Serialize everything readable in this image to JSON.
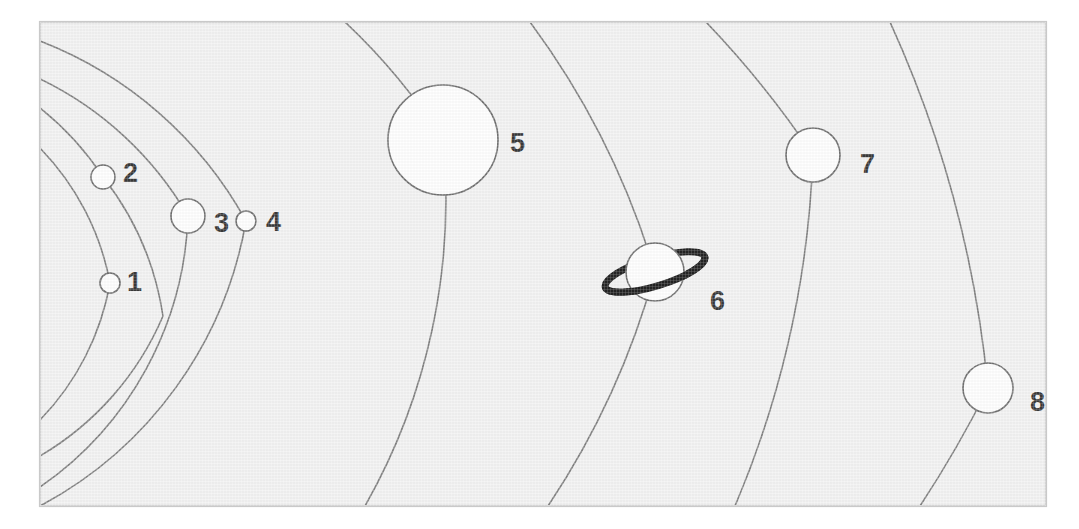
{
  "figure": {
    "background_color": "#f1f1f1",
    "frame_color": "#c9c9c9",
    "orbit_color": "#6e6e6e",
    "planet_fill": "#ffffff",
    "planet_stroke": "#5a5a5a",
    "ring_color": "#000000",
    "label_color": "#1a1a1a"
  },
  "frame": {
    "x": 40,
    "y": 22,
    "width": 1006,
    "height": 484
  },
  "sun": {
    "center_x": -150,
    "center_y": 264,
    "visible": false
  },
  "planets": [
    {
      "label": "1",
      "cx": 110,
      "cy": 283,
      "r": 10,
      "orbit_r": 262,
      "label_x": 127,
      "label_y": 284,
      "has_ring": false
    },
    {
      "label": "2",
      "cx": 103,
      "cy": 177,
      "r": 12,
      "orbit_r": 297,
      "label_x": 123,
      "label_y": 175,
      "has_ring": false
    },
    {
      "label": "3",
      "cx": 188,
      "cy": 216,
      "r": 17,
      "orbit_r": 344,
      "label_x": 214,
      "label_y": 225,
      "has_ring": false
    },
    {
      "label": "4",
      "cx": 246,
      "cy": 221,
      "r": 10,
      "orbit_r": 400,
      "label_x": 266,
      "label_y": 224,
      "has_ring": false
    },
    {
      "label": "5",
      "cx": 443,
      "cy": 140,
      "r": 55,
      "orbit_r": 620,
      "label_x": 510,
      "label_y": 145,
      "has_ring": false
    },
    {
      "label": "6",
      "cx": 655,
      "cy": 272,
      "r": 29,
      "orbit_r": 806,
      "label_x": 710,
      "label_y": 303,
      "has_ring": true,
      "ring_rx": 52,
      "ring_ry": 14,
      "ring_rotation": -17
    },
    {
      "label": "7",
      "cx": 813,
      "cy": 155,
      "r": 27,
      "orbit_r": 990,
      "label_x": 860,
      "label_y": 166,
      "has_ring": false
    },
    {
      "label": "8",
      "cx": 988,
      "cy": 388,
      "r": 25,
      "orbit_r": 1145,
      "label_x": 1030,
      "label_y": 404,
      "has_ring": false
    }
  ],
  "orbit_paths": [
    "M 40 148 A 262 262 0 0 1 110 283 A 262 262 0 0 1 40 420",
    "M 40 108 A 297 297 0 0 1 103 177 A 297 297 0 0 1 163 316 A 297 297 0 0 1 40 456",
    "M 40 79 A 344 344 0 0 1 188 216 A 344 344 0 0 1 40 487",
    "M 40 41 A 400 400 0 0 1 246 221 A 400 400 0 0 1 40 506",
    "M 345 22 A 620 620 0 0 1 443 140 A 620 620 0 0 1 365 506",
    "M 530 22 A 806 806 0 0 1 655 272 A 806 806 0 0 1 548 506",
    "M 706 22 A 990 990 0 0 1 813 155 A 990 990 0 0 1 735 506",
    "M 890 22 A 1145 1145 0 0 1 988 388 A 1145 1145 0 0 1 920 506"
  ],
  "legend": {
    "note": "Numbers 1 through 8 label the planets in order of increasing distance from the Sun."
  }
}
